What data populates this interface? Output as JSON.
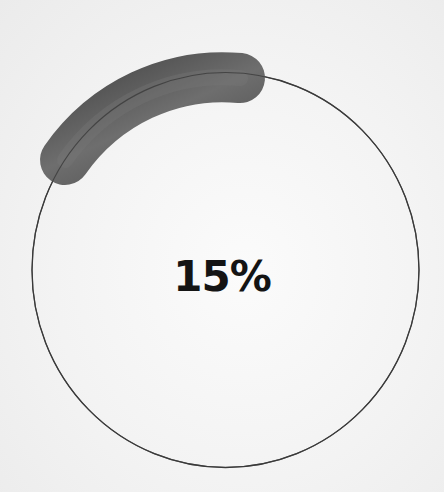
{
  "progress": {
    "label": "15%",
    "value": 15,
    "ring_color": "#3a3a3a",
    "arc_color": "#555555"
  }
}
